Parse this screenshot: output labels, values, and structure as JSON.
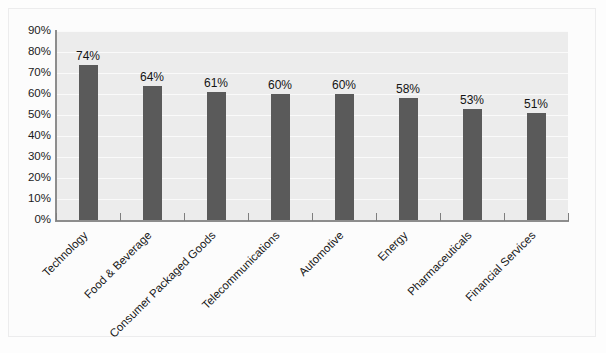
{
  "chart_data": {
    "type": "bar",
    "title": "",
    "subtitle": "",
    "xlabel": "",
    "ylabel": "",
    "ylim": [
      0,
      90
    ],
    "grid": true,
    "legend": "none",
    "orientation": "vertical",
    "value_suffix": "%",
    "categories": [
      "Technology",
      "Food & Beverage",
      "Consumer Packaged Goods",
      "Telecommunications",
      "Automotive",
      "Energy",
      "Pharmaceuticals",
      "Financial Services"
    ],
    "values": [
      74,
      64,
      61,
      60,
      60,
      58,
      53,
      51
    ],
    "value_labels": [
      "74%",
      "64%",
      "61%",
      "60%",
      "60%",
      "58%",
      "53%",
      "51%"
    ],
    "y_ticks": [
      0,
      10,
      20,
      30,
      40,
      50,
      60,
      70,
      80,
      90
    ],
    "y_tick_labels": [
      "0%",
      "10%",
      "20%",
      "30%",
      "40%",
      "50%",
      "60%",
      "70%",
      "80%",
      "90%"
    ],
    "colors": {
      "bar": "#5a5a5a",
      "plot_background": "#ececec",
      "gridline": "#fafafa",
      "axis": "#8d8d8d",
      "text": "#171717",
      "page_background": "#fdfdfd",
      "frame_border": "#ececed"
    }
  }
}
